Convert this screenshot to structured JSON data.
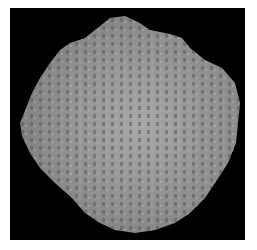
{
  "image": {
    "description": "Grayscale micrograph of a roughly circular tissue section with mottled cellular texture on a black background",
    "background_color": "#000000",
    "border_color": "#ffffff",
    "specimen_color": "#9a9a9a",
    "spot_color": "#5e5e5e"
  }
}
